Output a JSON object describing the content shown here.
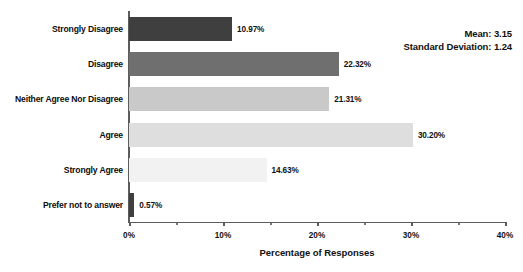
{
  "chart_data": {
    "type": "bar",
    "orientation": "horizontal",
    "title": "",
    "xlabel": "Percentage of Responses",
    "ylabel": "",
    "categories": [
      "Strongly Disagree",
      "Disagree",
      "Neither Agree Nor Disagree",
      "Agree",
      "Strongly Agree",
      "Prefer not to answer"
    ],
    "values": [
      10.97,
      22.32,
      21.31,
      30.2,
      14.63,
      0.57
    ],
    "value_labels": [
      "10.97%",
      "22.32%",
      "21.31%",
      "30.20%",
      "14.63%",
      "0.57%"
    ],
    "bar_colors": [
      "#3f3f3f",
      "#6f6f6f",
      "#c9c9c9",
      "#dedede",
      "#f2f2f2",
      "#3f3f3f"
    ],
    "xlim": [
      0,
      40
    ],
    "xticks": [
      0,
      10,
      20,
      30,
      40
    ],
    "xtick_labels": [
      "0%",
      "10%",
      "20%",
      "30%",
      "40%"
    ],
    "minor_xticks": [
      5,
      15,
      25,
      35
    ],
    "grid": false,
    "legend": null,
    "annotations": {
      "mean_label": "Mean: 3.15",
      "std_label": "Standard Deviation: 1.24",
      "position": "top-right"
    }
  },
  "axis": {
    "line_color": "#5c5c5c"
  }
}
